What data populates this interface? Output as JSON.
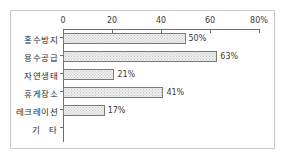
{
  "chart_data": {
    "type": "bar",
    "orientation": "horizontal",
    "title": "",
    "xlabel": "",
    "ylabel": "",
    "xlim": [
      0,
      80
    ],
    "grid": false,
    "legend": null,
    "categories": [
      "홍수방지",
      "용수공급",
      "자연생태",
      "휴게장소",
      "레크레이션",
      "기    타"
    ],
    "values": [
      50,
      63,
      21,
      41,
      17,
      0
    ],
    "value_labels": [
      "50%",
      "63%",
      "21%",
      "41%",
      "17%",
      ""
    ],
    "xticks": [
      0,
      20,
      40,
      60,
      80
    ],
    "xtick_labels": [
      "0",
      "20",
      "40",
      "60",
      "80%"
    ],
    "axis_color": "#6d6d6d",
    "bar_edge_color": "#7a7a7a",
    "bar_fill_color": "#efefef",
    "frame_color": "#c9c9c9"
  }
}
